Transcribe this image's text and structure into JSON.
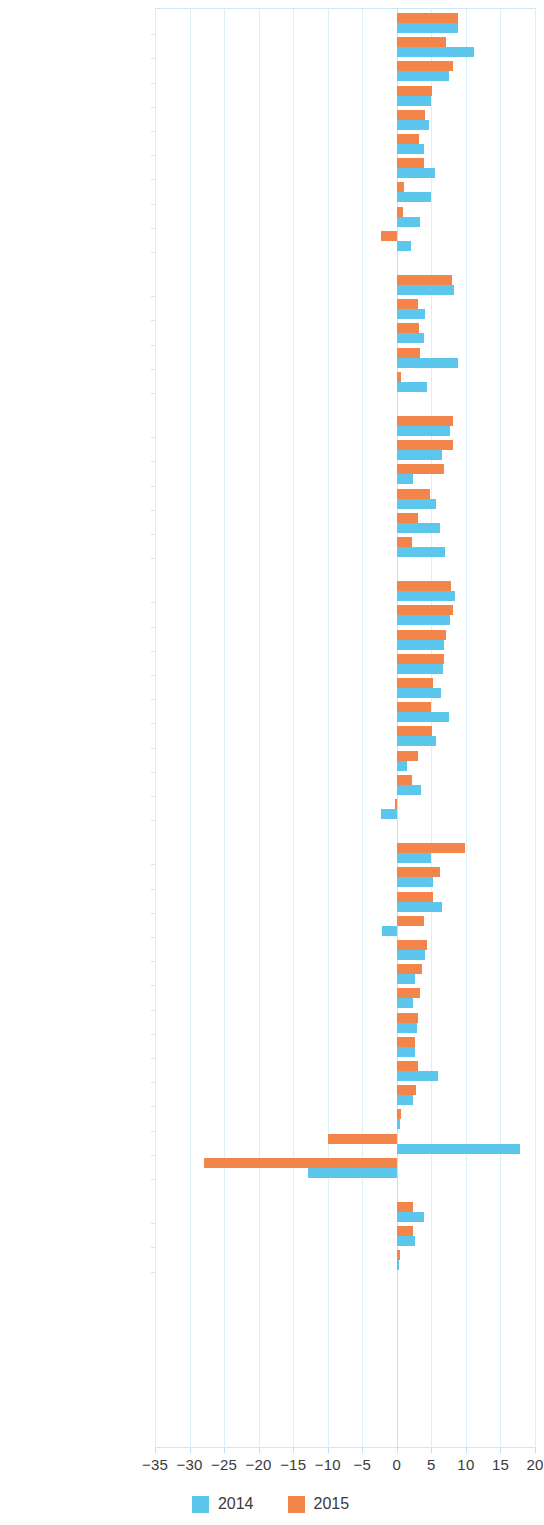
{
  "chart_data": {
    "type": "bar",
    "orientation": "horizontal",
    "title": "",
    "subtitle": "",
    "xlabel": "",
    "ylabel": "",
    "xlim": [
      -35,
      20
    ],
    "xticks": [
      -35,
      -30,
      -25,
      -20,
      -15,
      -10,
      -5,
      0,
      5,
      10,
      15,
      20
    ],
    "xtick_labels": [
      "−35",
      "−30",
      "−25",
      "−20",
      "−15",
      "−10",
      "−5",
      "0",
      "5",
      "10",
      "15",
      "20"
    ],
    "grid": true,
    "grid_axis": "x",
    "legend": {
      "position": "bottom",
      "entries": [
        {
          "name": "2014",
          "color": "#5cc6ec"
        },
        {
          "name": "2015",
          "color": "#f4854a"
        }
      ]
    },
    "series": [
      {
        "name": "2014",
        "color": "#5cc6ec"
      },
      {
        "name": "2015",
        "color": "#f4854a"
      }
    ],
    "groups": [
      {
        "name": "Central and West Asia",
        "rows": [
          {
            "category": "Uzbekistan",
            "v2014": 8.9,
            "v2015": 8.9
          },
          {
            "category": "Turkmenistan",
            "v2014": 11.1,
            "v2015": 7.1
          },
          {
            "category": "Tajikistan",
            "v2014": 7.5,
            "v2015": 8.2
          },
          {
            "category": "Pakistan",
            "v2014": 4.9,
            "v2015": 5.1
          },
          {
            "category": "Kyrgyz Republic",
            "v2014": 4.6,
            "v2015": 4.1
          },
          {
            "category": "Armenia",
            "v2014": 3.9,
            "v2015": 3.2
          },
          {
            "category": "Georgia",
            "v2014": 5.5,
            "v2015": 3.9
          },
          {
            "category": "Kazakhstan",
            "v2014": 4.9,
            "v2015": 1.0
          },
          {
            "category": "Azerbaijan",
            "v2014": 3.3,
            "v2015": 0.9
          },
          {
            "category": "Afghanistan",
            "v2014": 2.0,
            "v2015": -2.3
          }
        ]
      },
      {
        "name": "East Asia",
        "rows": [
          {
            "category": "PRC",
            "v2014": 8.3,
            "v2015": 8.0
          },
          {
            "category": "Korea, Rep. of",
            "v2014": 4.1,
            "v2015": 3.1
          },
          {
            "category": "Hong Kong, China",
            "v2014": 4.0,
            "v2015": 3.2
          },
          {
            "category": "Mongolia",
            "v2014": 8.8,
            "v2015": 3.3
          },
          {
            "category": "Taipei,China",
            "v2014": 4.4,
            "v2015": 0.6
          }
        ]
      },
      {
        "name": "South Asia",
        "rows": [
          {
            "category": "India",
            "v2014": 7.7,
            "v2015": 8.1
          },
          {
            "category": "Bangladesh",
            "v2014": 6.6,
            "v2015": 8.1
          },
          {
            "category": "Bhutan",
            "v2014": 2.4,
            "v2015": 6.8
          },
          {
            "category": "Sri Lanka",
            "v2014": 5.6,
            "v2015": 4.8
          },
          {
            "category": "Nepal",
            "v2014": 6.2,
            "v2015": 3.0
          },
          {
            "category": "Maldives",
            "v2014": 7.0,
            "v2015": 2.2
          }
        ]
      },
      {
        "name": "Southeast Asia",
        "rows": [
          {
            "category": "Myanmar",
            "v2014": 8.4,
            "v2015": 7.8
          },
          {
            "category": "Cambodia",
            "v2014": 7.7,
            "v2015": 8.1
          },
          {
            "category": "Viet Nam",
            "v2014": 6.8,
            "v2015": 7.1
          },
          {
            "category": "Philippines",
            "v2014": 6.7,
            "v2015": 6.9
          },
          {
            "category": "Malaysia",
            "v2014": 6.4,
            "v2015": 5.3
          },
          {
            "category": "Lao PDR",
            "v2014": 7.6,
            "v2015": 5.0
          },
          {
            "category": "Indonesia",
            "v2014": 5.6,
            "v2015": 5.1
          },
          {
            "category": "Thailand",
            "v2014": 1.5,
            "v2015": 3.0
          },
          {
            "category": "Singapore",
            "v2014": 3.5,
            "v2015": 2.2
          },
          {
            "category": "Brunei Darussalam",
            "v2014": -2.3,
            "v2015": -0.2
          }
        ]
      },
      {
        "name": "The Pacific",
        "rows": [
          {
            "category": "Palau",
            "v2014": 4.9,
            "v2015": 9.8
          },
          {
            "category": "Fiji",
            "v2014": 5.3,
            "v2015": 6.2
          },
          {
            "category": "Cook Islands",
            "v2014": 6.5,
            "v2015": 5.3
          },
          {
            "category": "FSM",
            "v2014": -2.2,
            "v2015": 4.0
          },
          {
            "category": "Papua New Guinea",
            "v2014": 4.1,
            "v2015": 4.3
          },
          {
            "category": "Tuvalu",
            "v2014": 2.7,
            "v2015": 3.6
          },
          {
            "category": "Tonga",
            "v2014": 2.4,
            "v2015": 3.4
          },
          {
            "category": "Solomon Islands",
            "v2014": 2.9,
            "v2015": 3.1
          },
          {
            "category": "Samoa",
            "v2014": 2.6,
            "v2015": 2.7
          },
          {
            "category": "Kiribati",
            "v2014": 6.0,
            "v2015": 3.0
          },
          {
            "category": "Vanuatu",
            "v2014": 2.3,
            "v2015": 2.8
          },
          {
            "category": "Marshall Islands",
            "v2014": 0.4,
            "v2015": 0.6
          },
          {
            "category": "Nauru",
            "v2014": 17.8,
            "v2015": -10.0
          },
          {
            "category": "Timor-Leste",
            "v2014": -12.9,
            "v2015": -27.9
          }
        ]
      },
      {
        "name": "Developed",
        "rows": [
          {
            "category": "New Zealand",
            "v2014": 3.9,
            "v2015": 2.4
          },
          {
            "category": "Australia",
            "v2014": 2.7,
            "v2015": 2.4
          },
          {
            "category": "Japan",
            "v2014": 0.3,
            "v2015": 0.5
          }
        ]
      }
    ]
  }
}
